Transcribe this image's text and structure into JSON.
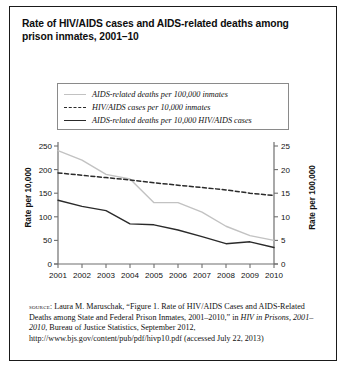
{
  "figure": {
    "title": "Rate of HIV/AIDS cases and AIDS-related deaths among prison inmates, 2001–10",
    "border_color": "#1a1a1a",
    "background": "#ffffff"
  },
  "legend": {
    "position": "top-center",
    "items": [
      {
        "label": "AIDS-related deaths per 100,000 inmates",
        "style": "solid",
        "color": "#c2c2c2",
        "swatch": "grey-solid-line"
      },
      {
        "label": "HIV/AIDS cases per 10,000 inmates",
        "style": "dashed",
        "color": "#2a2a2a",
        "swatch": "black-dashed-line"
      },
      {
        "label": "AIDS-related deaths per 10,000 HIV/AIDS cases",
        "style": "solid",
        "color": "#2a2a2a",
        "swatch": "black-solid-line"
      }
    ]
  },
  "axes": {
    "left_title": "Rate per 10,000",
    "right_title": "Rate per 100,000",
    "left_ticks": [
      "0",
      "50",
      "100",
      "150",
      "200",
      "250"
    ],
    "right_ticks": [
      "0",
      "5",
      "10",
      "15",
      "20",
      "25"
    ],
    "x_ticks": [
      "2001",
      "2002",
      "2003",
      "2004",
      "2005",
      "2006",
      "2007",
      "2008",
      "2009",
      "2010"
    ]
  },
  "chart_data": {
    "type": "line",
    "title": "Rate of HIV/AIDS cases and AIDS-related deaths among prison inmates, 2001–10",
    "xlabel": "",
    "ylabel": "Rate per 10,000",
    "y2label": "Rate per 100,000",
    "x": [
      2001,
      2002,
      2003,
      2004,
      2005,
      2006,
      2007,
      2008,
      2009,
      2010
    ],
    "ylim": [
      0,
      250
    ],
    "y2lim": [
      0,
      25
    ],
    "grid": false,
    "legend_position": "top-center",
    "series": [
      {
        "name": "AIDS-related deaths per 100,000 inmates",
        "axis": "right",
        "style": "solid",
        "color": "#c2c2c2",
        "values": [
          24,
          22,
          19,
          18,
          13,
          13,
          11,
          8,
          6,
          5
        ]
      },
      {
        "name": "HIV/AIDS cases per 10,000 inmates",
        "axis": "left",
        "style": "dashed",
        "color": "#2a2a2a",
        "values": [
          193,
          188,
          183,
          178,
          172,
          167,
          162,
          157,
          150,
          145
        ]
      },
      {
        "name": "AIDS-related deaths per 10,000 HIV/AIDS cases",
        "axis": "left",
        "style": "solid",
        "color": "#2a2a2a",
        "values": [
          135,
          122,
          113,
          85,
          83,
          72,
          58,
          43,
          47,
          35
        ]
      }
    ]
  },
  "source": {
    "label": "source:",
    "line1": " Laura M. Maruschak, “Figure 1. Rate of HIV/AIDS Cases and AIDS-Related Deaths among State and Federal Prison Inmates, 2001–2010,” in ",
    "italic1": "HIV in Prisons, 2001–2010",
    "line2": ", Bureau of Justice Statistics, September 2012, http://www.bjs.gov/content/pub/pdf/hivp10.pdf (accessed July 22, 2013)"
  }
}
